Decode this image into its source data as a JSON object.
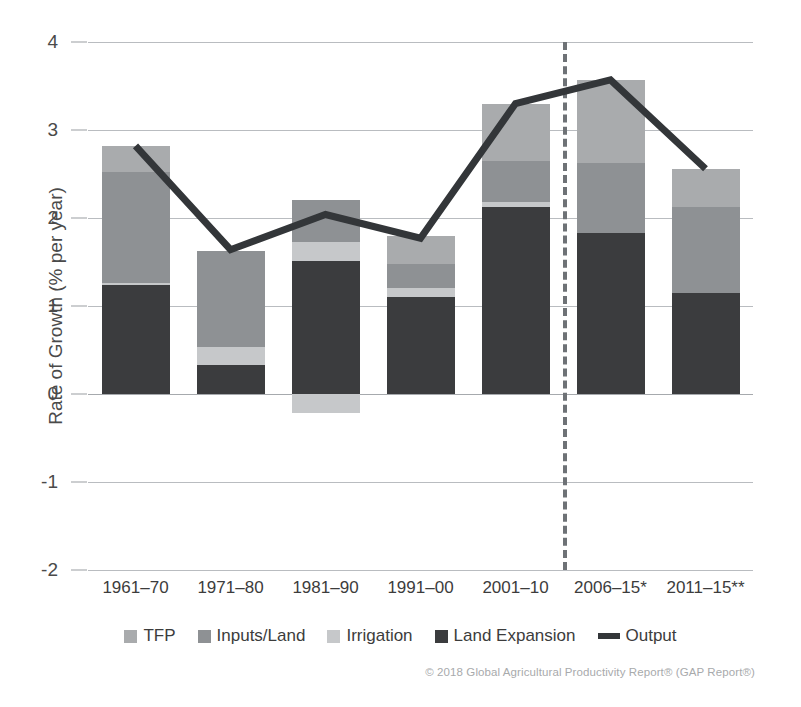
{
  "chart_data": {
    "type": "bar",
    "subtype": "stacked-bar-with-overlay-line",
    "title": "",
    "xlabel": "",
    "ylabel": "Rate of Growth (% per year)",
    "ylim": [
      -2,
      4
    ],
    "ytick_labels": [
      "4",
      "3",
      "2",
      "1",
      "0",
      "-1",
      "-2"
    ],
    "yticks": [
      4,
      3,
      2,
      1,
      0,
      -1,
      -2
    ],
    "grid": true,
    "legend_position": "bottom",
    "categories": [
      "1961–70",
      "1971–80",
      "1981–90",
      "1991–00",
      "2001–10",
      "2006–15*",
      "2011–15**"
    ],
    "series": [
      {
        "name": "Land Expansion",
        "color": "#3b3c3e",
        "values": [
          1.24,
          0.33,
          1.51,
          1.1,
          2.12,
          1.83,
          1.15
        ]
      },
      {
        "name": "Irrigation",
        "color": "#c6c8ca",
        "values": [
          0.02,
          0.2,
          0.22,
          0.1,
          0.06,
          0.0,
          0.0
        ]
      },
      {
        "name": "Inputs/Land",
        "color": "#8e9194",
        "values": [
          1.26,
          1.1,
          0.47,
          0.28,
          0.47,
          0.79,
          0.97
        ]
      },
      {
        "name": "TFP",
        "color": "#a9abad",
        "values": [
          0.3,
          0.0,
          0.0,
          0.31,
          0.65,
          0.95,
          0.44
        ]
      }
    ],
    "negative_segments": [
      {
        "name": "Irrigation",
        "color": "#c6c8ca",
        "values": [
          0.0,
          0.0,
          -0.22,
          0.0,
          0.0,
          0.0,
          0.0
        ]
      }
    ],
    "bar_totals": [
      2.82,
      1.63,
      2.2,
      1.79,
      3.3,
      3.57,
      2.56
    ],
    "line_series": {
      "name": "Output",
      "color": "#333639",
      "values": [
        2.82,
        1.64,
        2.04,
        1.77,
        3.3,
        3.57,
        2.56
      ]
    },
    "divider": {
      "after_category_index": 4,
      "style": "dashed",
      "color": "#6e7276"
    }
  },
  "legend": {
    "items": [
      {
        "label": "TFP",
        "color": "#a9abad",
        "kind": "swatch"
      },
      {
        "label": "Inputs/Land",
        "color": "#8e9194",
        "kind": "swatch"
      },
      {
        "label": "Irrigation",
        "color": "#c6c8ca",
        "kind": "swatch"
      },
      {
        "label": "Land Expansion",
        "color": "#3b3c3e",
        "kind": "swatch"
      },
      {
        "label": "Output",
        "color": "#333639",
        "kind": "line"
      }
    ]
  },
  "credit": {
    "text": "© 2018 Global Agricultural Productivity Report® (GAP Report®)"
  }
}
